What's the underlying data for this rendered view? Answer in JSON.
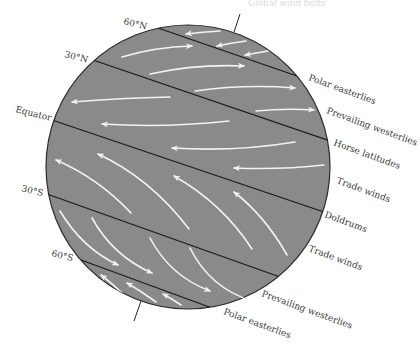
{
  "figure": {
    "header_ghost_text": "Global wind belts",
    "colors": {
      "globe_fill": "#8a8a8a",
      "band_line": "#1a1a1a",
      "arrow": "#f2f2f2",
      "label_text": "#3a3a3a",
      "background": "#ffffff"
    },
    "latitude_labels": [
      {
        "id": "60N",
        "text": "60°N"
      },
      {
        "id": "30N",
        "text": "30°N"
      },
      {
        "id": "equator",
        "text": "Equator"
      },
      {
        "id": "30S",
        "text": "30°S"
      },
      {
        "id": "60S",
        "text": "60°S"
      }
    ],
    "belt_labels": [
      {
        "id": "polar-easterlies-n",
        "text": "Polar easterlies"
      },
      {
        "id": "prevailing-westerlies-n",
        "text": "Prevailing westerlies"
      },
      {
        "id": "horse-latitudes",
        "text": "Horse latitudes"
      },
      {
        "id": "trade-winds-n",
        "text": "Trade winds"
      },
      {
        "id": "doldrums",
        "text": "Doldrums"
      },
      {
        "id": "trade-winds-s",
        "text": "Trade winds"
      },
      {
        "id": "prevailing-westerlies-s",
        "text": "Prevailing westerlies"
      },
      {
        "id": "polar-easterlies-s",
        "text": "Polar easterlies"
      }
    ],
    "wind_bands": [
      {
        "name": "Polar easterlies (N)",
        "direction": "east-to-west",
        "arrow_count": 3
      },
      {
        "name": "Prevailing westerlies (N)",
        "direction": "west-to-east",
        "arrow_count": 4
      },
      {
        "name": "Trade winds (N)",
        "direction": "east-to-west",
        "arrow_count": 4
      },
      {
        "name": "Trade winds (S)",
        "direction": "southeast-to-northwest",
        "arrow_count": 4
      },
      {
        "name": "Prevailing westerlies (S)",
        "direction": "northwest-to-southeast",
        "arrow_count": 4
      },
      {
        "name": "Polar easterlies (S)",
        "direction": "southeast-to-northwest",
        "arrow_count": 3
      }
    ]
  }
}
